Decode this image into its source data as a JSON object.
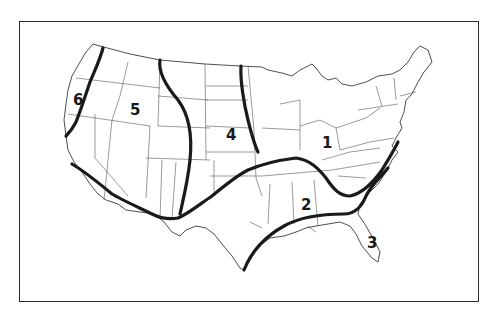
{
  "map": {
    "subject": "Contiguous United States divided into numbered zones",
    "regions": [
      {
        "id": "1",
        "label": "1"
      },
      {
        "id": "2",
        "label": "2"
      },
      {
        "id": "3",
        "label": "3"
      },
      {
        "id": "4",
        "label": "4"
      },
      {
        "id": "5",
        "label": "5"
      },
      {
        "id": "6",
        "label": "6"
      }
    ],
    "colors": {
      "zone_lines": "#1a1a1a",
      "state_lines": "#555555",
      "frame": "#2a2a2a",
      "background": "#ffffff"
    }
  }
}
